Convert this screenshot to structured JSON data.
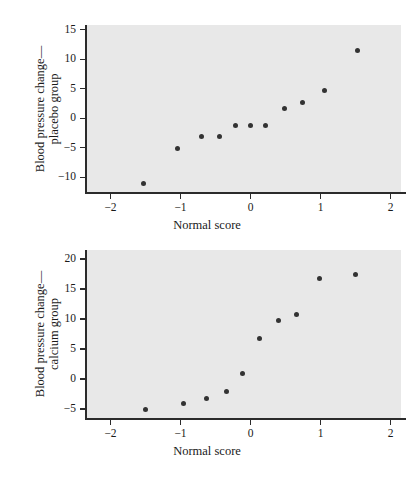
{
  "page": {
    "background_color": "#ffffff",
    "panel_color": "#e8e8e8",
    "axis_color": "#2b2b2b",
    "point_color": "#333333"
  },
  "chart_data": [
    {
      "id": "placebo",
      "type": "scatter",
      "title": "",
      "xlabel": "Normal score",
      "ylabel": "Blood pressure change—placebo group",
      "ylabel_line1": "Blood pressure change—",
      "ylabel_line2": "placebo group",
      "xlim": [
        -2.35,
        2.15
      ],
      "ylim": [
        -12.5,
        15.8
      ],
      "xticks": [
        -2,
        -1,
        0,
        1,
        2
      ],
      "xticklabels": [
        "−2",
        "−1",
        "0",
        "1",
        "2"
      ],
      "yticks": [
        -10,
        -5,
        0,
        5,
        10,
        15
      ],
      "yticklabels": [
        "−10",
        "−5",
        "0",
        "5",
        "10",
        "15"
      ],
      "grid": false,
      "legend": "none",
      "x": [
        -1.53,
        -1.05,
        -0.7,
        -0.45,
        -0.21,
        0.0,
        0.21,
        0.48,
        0.74,
        1.05,
        1.53
      ],
      "y": [
        -11.0,
        -5.1,
        -3.1,
        -3.1,
        -1.2,
        -1.2,
        -1.2,
        1.7,
        2.7,
        4.7,
        11.5
      ]
    },
    {
      "id": "calcium",
      "type": "scatter",
      "title": "",
      "xlabel": "Normal score",
      "ylabel": "Blood pressure change—calcium group",
      "ylabel_line1": "Blood pressure change—",
      "ylabel_line2": "calcium group",
      "xlim": [
        -2.35,
        2.15
      ],
      "ylim": [
        -6.5,
        21.5
      ],
      "xticks": [
        -2,
        -1,
        0,
        1,
        2
      ],
      "xticklabels": [
        "−2",
        "−1",
        "0",
        "1",
        "2"
      ],
      "yticks": [
        -5,
        0,
        5,
        10,
        15,
        20
      ],
      "yticklabels": [
        "−5",
        "0",
        "5",
        "10",
        "15",
        "20"
      ],
      "grid": false,
      "legend": "none",
      "x": [
        -1.5,
        -0.96,
        -0.63,
        -0.35,
        -0.11,
        0.13,
        0.4,
        0.66,
        0.99,
        1.5
      ],
      "y": [
        -5.0,
        -4.0,
        -3.2,
        -2.1,
        0.9,
        6.8,
        9.8,
        10.8,
        16.7,
        17.5
      ]
    }
  ]
}
